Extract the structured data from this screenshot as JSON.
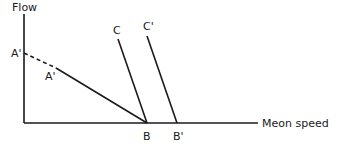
{
  "diagram": {
    "axes": {
      "y_label": "Flow",
      "x_label": "Meon speed"
    },
    "points": {
      "a_prime_axis": "A'",
      "a_prime_line": "A'",
      "b": "B",
      "b_prime": "B'",
      "c": "C",
      "c_prime": "C'"
    },
    "lines": [
      {
        "name": "A'-A' dashed extension",
        "style": "dashed",
        "from": [
          24,
          53
        ],
        "to": [
          56,
          68
        ]
      },
      {
        "name": "A'-B",
        "style": "solid",
        "from": [
          56,
          68
        ],
        "to": [
          147,
          123
        ]
      },
      {
        "name": "C-B",
        "style": "solid",
        "from": [
          118,
          38
        ],
        "to": [
          147,
          123
        ]
      },
      {
        "name": "C'-B'",
        "style": "solid",
        "from": [
          147,
          35
        ],
        "to": [
          177,
          123
        ]
      }
    ],
    "colors": {
      "ink": "#1a1a1a",
      "background": "#ffffff"
    }
  }
}
